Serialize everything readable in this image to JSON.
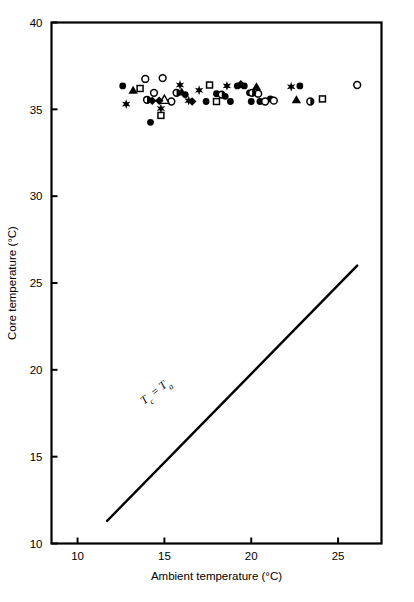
{
  "chart_data": {
    "type": "scatter",
    "title": "",
    "xlabel": "Ambient temperature (°C)",
    "ylabel": "Core temperature (°C)",
    "xlim": [
      8.5,
      27.5
    ],
    "ylim": [
      10,
      40
    ],
    "xticks": [
      10,
      15,
      20,
      25
    ],
    "yticks": [
      10,
      15,
      20,
      25,
      30,
      35,
      40
    ],
    "xtick_labels": [
      "10",
      "15",
      "20",
      "25"
    ],
    "ytick_labels": [
      "10",
      "15",
      "20",
      "25",
      "30",
      "35",
      "40"
    ],
    "grid": false,
    "legend": null,
    "annotations": [
      {
        "name": "identity-line-label",
        "text": "Tc = Ta",
        "text_main": "T",
        "text_sub1": "c",
        "text_eq": " = ",
        "text_main2": "T",
        "text_sub2": "a",
        "x": 14.6,
        "y": 18.6,
        "rotation_deg": -38
      }
    ],
    "reference_line": {
      "name": "identity-line",
      "label": "Tc = Ta",
      "x_start": 11.7,
      "y_start": 11.3,
      "x_end": 26.1,
      "y_end": 26.0,
      "color": "#000000",
      "width": 2.4
    },
    "series": [
      {
        "name": "Filled circles",
        "marker": "filled-circle",
        "color": "#000000",
        "points": [
          [
            12.6,
            36.35
          ],
          [
            14.2,
            34.25
          ],
          [
            16.2,
            35.85
          ],
          [
            18.5,
            35.75
          ],
          [
            19.2,
            36.35
          ],
          [
            19.6,
            36.35
          ],
          [
            19.9,
            35.95
          ],
          [
            20.5,
            35.45
          ],
          [
            18.0,
            35.9
          ],
          [
            17.4,
            35.45
          ],
          [
            21.1,
            35.6
          ],
          [
            22.8,
            36.35
          ],
          [
            20.0,
            35.45
          ],
          [
            18.8,
            35.45
          ]
        ]
      },
      {
        "name": "Open circles",
        "marker": "open-circle",
        "color": "#000000",
        "points": [
          [
            13.9,
            36.75
          ],
          [
            14.9,
            36.8
          ],
          [
            15.4,
            35.45
          ],
          [
            21.3,
            35.5
          ],
          [
            20.8,
            35.45
          ],
          [
            20.4,
            35.9
          ],
          [
            26.1,
            36.4
          ],
          [
            14.4,
            35.95
          ]
        ]
      },
      {
        "name": "Filled triangles",
        "marker": "filled-triangle",
        "color": "#000000",
        "points": [
          [
            13.2,
            36.1
          ],
          [
            16.0,
            36.0
          ],
          [
            20.3,
            36.3
          ],
          [
            22.6,
            35.55
          ]
        ]
      },
      {
        "name": "Open triangles",
        "marker": "open-triangle",
        "color": "#000000",
        "points": [
          [
            15.0,
            35.55
          ]
        ]
      },
      {
        "name": "Open squares",
        "marker": "open-square",
        "color": "#000000",
        "points": [
          [
            13.6,
            36.2
          ],
          [
            14.8,
            34.65
          ],
          [
            17.6,
            36.4
          ],
          [
            18.0,
            35.45
          ],
          [
            24.1,
            35.6
          ]
        ]
      },
      {
        "name": "Filled stars",
        "marker": "filled-star",
        "color": "#000000",
        "points": [
          [
            15.9,
            36.4
          ],
          [
            12.8,
            35.3
          ],
          [
            14.8,
            35.05
          ],
          [
            16.4,
            35.5
          ],
          [
            17.0,
            36.1
          ],
          [
            18.6,
            36.35
          ],
          [
            22.3,
            36.3
          ]
        ]
      },
      {
        "name": "Filled diamonds",
        "marker": "filled-diamond",
        "color": "#000000",
        "points": [
          [
            14.3,
            35.5
          ],
          [
            14.7,
            35.5
          ],
          [
            16.6,
            35.45
          ],
          [
            19.4,
            36.45
          ]
        ]
      },
      {
        "name": "Half-filled circles",
        "marker": "half-circle",
        "color": "#000000",
        "points": [
          [
            14.0,
            35.55
          ],
          [
            15.7,
            35.95
          ],
          [
            20.05,
            35.95
          ],
          [
            23.4,
            35.45
          ],
          [
            18.3,
            35.85
          ]
        ]
      }
    ]
  }
}
